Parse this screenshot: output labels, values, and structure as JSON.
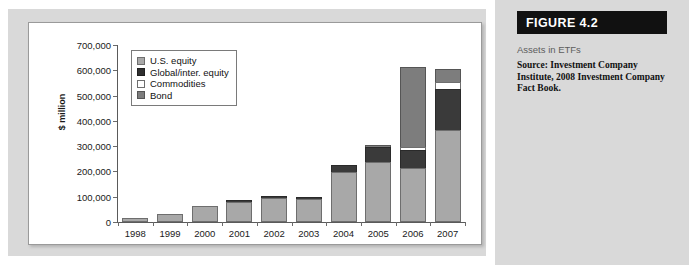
{
  "figure": {
    "banner_label": "FIGURE 4.2",
    "caption": "Assets in ETFs",
    "source": "Source: Investment Company Institute, 2008 Investment Company Fact Book."
  },
  "chart_data": {
    "type": "bar",
    "stacked": true,
    "title": "Assets in ETFs",
    "xlabel": "",
    "ylabel": "$ million",
    "ylim": [
      0,
      700000
    ],
    "ytick_labels": [
      "700,000",
      "600,000",
      "500,000",
      "400,000",
      "300,000",
      "200,000",
      "100,000",
      "0"
    ],
    "ytick_values": [
      700000,
      600000,
      500000,
      400000,
      300000,
      200000,
      100000,
      0
    ],
    "grid": false,
    "legend_position": "upper-left",
    "categories": [
      "1998",
      "1999",
      "2000",
      "2001",
      "2002",
      "2003",
      "2004",
      "2005",
      "2006",
      "2007"
    ],
    "series": [
      {
        "name": "U.S. equity",
        "color": "#a8a8a8",
        "values": [
          15000,
          33000,
          65000,
          79000,
          95000,
          92000,
          196000,
          237000,
          215000,
          365000
        ]
      },
      {
        "name": "Global/inter. equity",
        "color": "#2f2f2f",
        "values": [
          0,
          0,
          0,
          3000,
          6000,
          6000,
          30000,
          58000,
          70000,
          160000
        ]
      },
      {
        "name": "Commodities",
        "color": "#ffffff",
        "values": [
          0,
          0,
          0,
          0,
          0,
          0,
          0,
          0,
          10000,
          30000
        ]
      },
      {
        "name": "Bond",
        "color": "#7d7d7d",
        "values": [
          0,
          0,
          0,
          0,
          0,
          0,
          0,
          5000,
          320000,
          50000
        ]
      }
    ],
    "totals": [
      15000,
      33000,
      65000,
      82000,
      101000,
      98000,
      226000,
      300000,
      615000,
      605000
    ]
  }
}
